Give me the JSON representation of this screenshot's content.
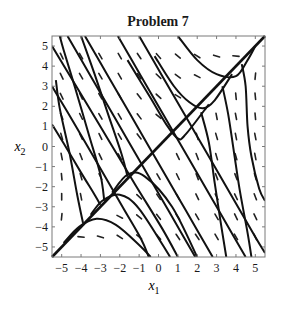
{
  "chart_data": {
    "type": "line",
    "subtype": "phase-portrait",
    "title": "Problem 7",
    "xlabel": "x",
    "xlabel_sub": "1",
    "ylabel": "x",
    "ylabel_sub": "2",
    "xlim": [
      -5.5,
      5.5
    ],
    "ylim": [
      -5.5,
      5.5
    ],
    "xticks": [
      -5,
      -4,
      -3,
      -2,
      -1,
      0,
      1,
      2,
      3,
      4,
      5
    ],
    "yticks": [
      -5,
      -4,
      -3,
      -2,
      -1,
      0,
      1,
      2,
      3,
      4,
      5
    ],
    "xtick_labels": [
      "−5",
      "−4",
      "−3",
      "−2",
      "−1",
      "0",
      "1",
      "2",
      "3",
      "4",
      "5"
    ],
    "ytick_labels": [
      "−5",
      "−4",
      "−3",
      "−2",
      "−1",
      "0",
      "1",
      "2",
      "3",
      "4",
      "5"
    ],
    "grid": false,
    "legend": null,
    "invariant_line": {
      "name": "x2 = x1",
      "points": [
        [
          -5.5,
          -5.5
        ],
        [
          5.5,
          5.5
        ]
      ]
    },
    "trajectories": [
      {
        "name": "left-entry-5",
        "points": [
          [
            -5.5,
            5.0
          ],
          [
            -4.0,
            2.6
          ],
          [
            -2.6,
            0.35
          ],
          [
            -1.2,
            -1.9
          ],
          [
            0.2,
            -4.1
          ],
          [
            1.0,
            -5.5
          ]
        ]
      },
      {
        "name": "left-entry-3",
        "points": [
          [
            -5.5,
            3.0
          ],
          [
            -4.2,
            0.9
          ],
          [
            -3.0,
            -1.1
          ],
          [
            -1.8,
            -3.1
          ],
          [
            -0.9,
            -4.6
          ],
          [
            -0.5,
            -5.5
          ]
        ]
      },
      {
        "name": "left-entry-1",
        "points": [
          [
            -5.5,
            1.1
          ],
          [
            -4.8,
            0.0
          ],
          [
            -4.0,
            -1.3
          ],
          [
            -3.3,
            -2.4
          ],
          [
            -3.0,
            -2.9
          ]
        ]
      },
      {
        "name": "top-entry-m4.7",
        "points": [
          [
            -4.7,
            5.5
          ],
          [
            -3.5,
            3.5
          ],
          [
            -2.3,
            1.5
          ],
          [
            -1.1,
            -0.5
          ],
          [
            0.1,
            -2.5
          ],
          [
            1.3,
            -4.5
          ],
          [
            1.9,
            -5.5
          ]
        ]
      },
      {
        "name": "top-entry-m3.8",
        "points": [
          [
            -3.8,
            5.5
          ],
          [
            -2.6,
            3.5
          ],
          [
            -1.4,
            1.5
          ],
          [
            -0.2,
            -0.5
          ],
          [
            1.0,
            -2.5
          ],
          [
            2.2,
            -4.5
          ],
          [
            2.8,
            -5.5
          ]
        ]
      },
      {
        "name": "top-entry-m2.1",
        "points": [
          [
            -2.1,
            5.5
          ],
          [
            -0.9,
            3.5
          ],
          [
            0.3,
            1.5
          ],
          [
            1.5,
            -0.5
          ],
          [
            2.7,
            -2.5
          ],
          [
            3.9,
            -4.5
          ],
          [
            4.5,
            -5.5
          ]
        ]
      },
      {
        "name": "top-entry-m1.0",
        "points": [
          [
            -1.0,
            5.5
          ],
          [
            0.2,
            3.5
          ],
          [
            1.4,
            1.5
          ],
          [
            2.6,
            -0.5
          ],
          [
            3.8,
            -2.5
          ],
          [
            5.0,
            -4.5
          ],
          [
            5.5,
            -5.3
          ]
        ]
      },
      {
        "name": "top-entry-1.0",
        "points": [
          [
            1.0,
            5.5
          ],
          [
            2.0,
            4.3
          ],
          [
            3.0,
            3.6
          ],
          [
            4.0,
            3.5
          ],
          [
            4.6,
            4.3
          ],
          [
            5.0,
            5.0
          ]
        ]
      },
      {
        "name": "upper-merge-1",
        "points": [
          [
            -0.2,
            4.5
          ],
          [
            0.8,
            3.0
          ],
          [
            1.6,
            2.2
          ],
          [
            2.3,
            1.9
          ],
          [
            2.9,
            2.3
          ],
          [
            3.8,
            3.6
          ]
        ]
      },
      {
        "name": "upper-merge-2",
        "points": [
          [
            -1.6,
            4.3
          ],
          [
            -0.4,
            2.4
          ],
          [
            0.4,
            1.1
          ],
          [
            1.0,
            0.4
          ],
          [
            1.4,
            0.6
          ],
          [
            2.6,
            2.1
          ]
        ]
      },
      {
        "name": "right-merge-1",
        "points": [
          [
            3.3,
            3.0
          ],
          [
            3.6,
            1.6
          ],
          [
            3.9,
            -0.3
          ],
          [
            4.2,
            -2.2
          ],
          [
            4.6,
            -4.3
          ],
          [
            4.8,
            -5.5
          ]
        ]
      },
      {
        "name": "right-merge-2",
        "points": [
          [
            2.2,
            1.7
          ],
          [
            2.6,
            0.2
          ],
          [
            2.9,
            -1.8
          ],
          [
            3.2,
            -3.7
          ],
          [
            3.5,
            -5.5
          ]
        ]
      },
      {
        "name": "right-merge-3",
        "points": [
          [
            4.3,
            4.1
          ],
          [
            4.5,
            3.0
          ],
          [
            4.6,
            1.0
          ],
          [
            4.8,
            -0.5
          ],
          [
            5.2,
            -2.1
          ],
          [
            5.5,
            -2.7
          ]
        ]
      },
      {
        "name": "lower-left-1",
        "points": [
          [
            -4.9,
            -4.8
          ],
          [
            -4.1,
            -4.0
          ],
          [
            -3.2,
            -3.6
          ],
          [
            -2.2,
            -3.9
          ],
          [
            -1.0,
            -4.9
          ],
          [
            -0.4,
            -5.5
          ]
        ]
      },
      {
        "name": "lower-left-2",
        "points": [
          [
            -3.5,
            -3.4
          ],
          [
            -2.9,
            -2.7
          ],
          [
            -2.0,
            -2.4
          ],
          [
            -1.0,
            -3.1
          ],
          [
            0.6,
            -5.5
          ]
        ]
      },
      {
        "name": "lower-left-3",
        "points": [
          [
            -2.4,
            -2.3
          ],
          [
            -1.6,
            -1.4
          ],
          [
            -0.7,
            -1.5
          ],
          [
            0.7,
            -3.0
          ],
          [
            2.0,
            -5.5
          ]
        ]
      },
      {
        "name": "left-merge-1",
        "points": [
          [
            -3.9,
            -3.8
          ],
          [
            -4.2,
            -2.4
          ],
          [
            -4.6,
            -0.3
          ],
          [
            -5.1,
            1.9
          ],
          [
            -5.3,
            3.3
          ]
        ]
      },
      {
        "name": "left-merge-2",
        "points": [
          [
            -2.8,
            -2.7
          ],
          [
            -3.0,
            -1.4
          ],
          [
            -3.6,
            0.6
          ],
          [
            -4.3,
            2.9
          ],
          [
            -4.9,
            4.8
          ],
          [
            -5.1,
            5.5
          ]
        ]
      },
      {
        "name": "left-merge-3",
        "points": [
          [
            -1.6,
            -1.5
          ],
          [
            -1.9,
            -0.4
          ],
          [
            -2.6,
            1.6
          ],
          [
            -3.3,
            3.6
          ],
          [
            -4.0,
            5.5
          ]
        ]
      }
    ],
    "direction_field": {
      "segment_length": 0.32,
      "vectors": [
        [
          -5.0,
          4.5,
          -0.5,
          1
        ],
        [
          -4.0,
          4.5,
          -0.6,
          1
        ],
        [
          -3.0,
          4.5,
          -0.6,
          1
        ],
        [
          -2.0,
          4.5,
          -0.6,
          1
        ],
        [
          -1.0,
          4.5,
          -0.7,
          1
        ],
        [
          0.0,
          4.5,
          -0.9,
          1
        ],
        [
          1.0,
          4.5,
          -1,
          0.8
        ],
        [
          2.0,
          4.5,
          -1,
          0.6
        ],
        [
          3.0,
          4.5,
          -1,
          0.3
        ],
        [
          4.0,
          4.5,
          -1,
          0.1
        ],
        [
          -5.0,
          3.5,
          -0.5,
          1
        ],
        [
          -4.0,
          3.5,
          -0.6,
          1
        ],
        [
          -3.0,
          3.5,
          -0.6,
          1
        ],
        [
          -2.0,
          3.5,
          -0.6,
          1
        ],
        [
          -1.0,
          3.5,
          -0.7,
          1
        ],
        [
          0.0,
          3.5,
          -1,
          0.9
        ],
        [
          1.0,
          3.5,
          -1,
          0.7
        ],
        [
          2.0,
          3.5,
          -1,
          0.5
        ],
        [
          5.0,
          3.5,
          0.1,
          1
        ],
        [
          -5.0,
          2.5,
          -0.5,
          1
        ],
        [
          -4.0,
          2.5,
          -0.5,
          1
        ],
        [
          -3.0,
          2.5,
          -0.6,
          1
        ],
        [
          -2.0,
          2.5,
          -0.6,
          1
        ],
        [
          -1.0,
          2.5,
          -0.8,
          1
        ],
        [
          0.0,
          2.5,
          -1,
          0.9
        ],
        [
          1.0,
          2.5,
          -1,
          0.6
        ],
        [
          4.0,
          2.5,
          -0.1,
          1
        ],
        [
          5.0,
          2.5,
          -0.1,
          1
        ],
        [
          -5.0,
          1.5,
          -0.4,
          1
        ],
        [
          -4.0,
          1.5,
          -0.5,
          1
        ],
        [
          -3.0,
          1.5,
          -0.6,
          1
        ],
        [
          -2.0,
          1.5,
          -0.6,
          1
        ],
        [
          -1.0,
          1.5,
          -0.8,
          1
        ],
        [
          0.0,
          1.5,
          -1,
          0.8
        ],
        [
          3.0,
          1.5,
          -0.2,
          1
        ],
        [
          4.0,
          1.5,
          -0.2,
          1
        ],
        [
          5.0,
          1.5,
          -0.1,
          1
        ],
        [
          -5.0,
          0.5,
          -0.3,
          1
        ],
        [
          -4.0,
          0.5,
          -0.5,
          1
        ],
        [
          -3.0,
          0.5,
          -0.5,
          1
        ],
        [
          -2.0,
          0.5,
          -0.6,
          1
        ],
        [
          -1.0,
          0.5,
          -0.8,
          1
        ],
        [
          2.0,
          0.5,
          -0.3,
          1
        ],
        [
          3.0,
          0.5,
          -0.3,
          1
        ],
        [
          4.0,
          0.5,
          -0.2,
          1
        ],
        [
          5.0,
          0.5,
          -0.2,
          1
        ],
        [
          -5.0,
          -0.5,
          -0.2,
          1
        ],
        [
          -4.0,
          -0.5,
          -0.4,
          1
        ],
        [
          -3.0,
          -0.5,
          -0.5,
          1
        ],
        [
          -2.0,
          -0.5,
          -0.6,
          1
        ],
        [
          1.0,
          -0.5,
          -0.5,
          1
        ],
        [
          2.0,
          -0.5,
          -0.4,
          1
        ],
        [
          3.0,
          -0.5,
          -0.3,
          1
        ],
        [
          4.0,
          -0.5,
          -0.3,
          1
        ],
        [
          5.0,
          -0.5,
          -0.2,
          1
        ],
        [
          -5.0,
          -1.5,
          -0.1,
          1
        ],
        [
          -4.0,
          -1.5,
          -0.3,
          1
        ],
        [
          -3.0,
          -1.5,
          -0.5,
          1
        ],
        [
          0.0,
          -1.5,
          -0.6,
          1
        ],
        [
          1.0,
          -1.5,
          -0.5,
          1
        ],
        [
          2.0,
          -1.5,
          -0.4,
          1
        ],
        [
          3.0,
          -1.5,
          -0.4,
          1
        ],
        [
          4.0,
          -1.5,
          -0.4,
          1
        ],
        [
          5.0,
          -1.5,
          -0.3,
          1
        ],
        [
          -5.0,
          -2.5,
          0.0,
          1
        ],
        [
          -4.0,
          -2.5,
          -0.2,
          1
        ],
        [
          -1.0,
          -2.5,
          -1,
          0.9
        ],
        [
          0.0,
          -2.5,
          -0.7,
          1
        ],
        [
          1.0,
          -2.5,
          -0.6,
          1
        ],
        [
          2.0,
          -2.5,
          -0.5,
          1
        ],
        [
          3.0,
          -2.5,
          -0.5,
          1
        ],
        [
          4.0,
          -2.5,
          -0.5,
          1
        ],
        [
          5.0,
          -2.5,
          -0.4,
          1
        ],
        [
          -5.0,
          -3.5,
          0.1,
          1
        ],
        [
          -2.0,
          -3.5,
          -1,
          0.5
        ],
        [
          -1.0,
          -3.5,
          -1,
          0.8
        ],
        [
          0.0,
          -3.5,
          -0.8,
          1
        ],
        [
          1.0,
          -3.5,
          -0.7,
          1
        ],
        [
          2.0,
          -3.5,
          -0.6,
          1
        ],
        [
          3.0,
          -3.5,
          -0.6,
          1
        ],
        [
          4.0,
          -3.5,
          -0.5,
          1
        ],
        [
          5.0,
          -3.5,
          -0.5,
          1
        ],
        [
          -4.0,
          -4.5,
          -1,
          0.1
        ],
        [
          -3.0,
          -4.5,
          -1,
          0.3
        ],
        [
          -2.0,
          -4.5,
          -1,
          0.6
        ],
        [
          -1.0,
          -4.5,
          -1,
          0.8
        ],
        [
          0.0,
          -4.5,
          -0.9,
          1
        ],
        [
          1.0,
          -4.5,
          -0.7,
          1
        ],
        [
          2.0,
          -4.5,
          -0.7,
          1
        ],
        [
          3.0,
          -4.5,
          -0.6,
          1
        ],
        [
          4.0,
          -4.5,
          -0.6,
          1
        ],
        [
          5.0,
          -4.5,
          -0.5,
          1
        ]
      ]
    }
  },
  "colors": {
    "background": "#ffffff",
    "frame": "#7a7a7a",
    "curve": "#111111",
    "arrow": "#222222",
    "text": "#1a1a1a"
  }
}
